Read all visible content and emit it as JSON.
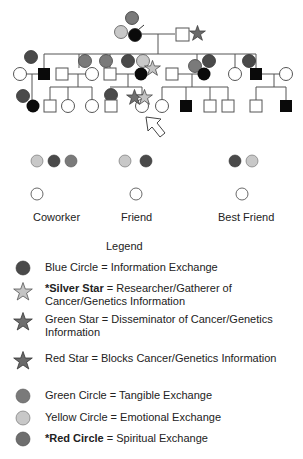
{
  "colors": {
    "blue": "#4a4a4a",
    "black": "#0a0a0a",
    "green": "#7a7a7a",
    "yellow": "#c8c8c8",
    "red": "#6e6e6e",
    "silver_star": "#c4c4c4",
    "green_star": "#6f6f6f",
    "red_star": "#6a6a6a",
    "line": "#555555"
  },
  "relations": [
    {
      "label": "Coworker",
      "dots": [
        "yellow",
        "blue",
        "green"
      ]
    },
    {
      "label": "Friend",
      "dots": [
        "yellow",
        "blue"
      ]
    },
    {
      "label": "Best Friend",
      "dots": [
        "blue",
        "yellow"
      ]
    }
  ],
  "legend": {
    "title": "Legend",
    "items": [
      {
        "icon": "blue-circle",
        "prefix": "",
        "bold": "",
        "text": "Blue Circle = Information Exchange"
      },
      {
        "icon": "silver-star",
        "prefix": "*",
        "bold": "Silver Star",
        "text": " = Researcher/Gatherer of Cancer/Genetics Information"
      },
      {
        "icon": "green-star",
        "prefix": "",
        "bold": "",
        "text": "Green Star = Disseminator of Cancer/Genetics Information"
      },
      {
        "icon": "red-star",
        "prefix": "",
        "bold": "",
        "text": "Red Star = Blocks Cancer/Genetics Information"
      },
      {
        "icon": "green-circle",
        "prefix": "",
        "bold": "",
        "text": "Green Circle = Tangible Exchange"
      },
      {
        "icon": "yellow-circle",
        "prefix": "",
        "bold": "",
        "text": "Yellow Circle = Emotional Exchange"
      },
      {
        "icon": "red-circle",
        "prefix": "*",
        "bold": "Red Circle",
        "text": " = Spiritual Exchange"
      }
    ]
  }
}
